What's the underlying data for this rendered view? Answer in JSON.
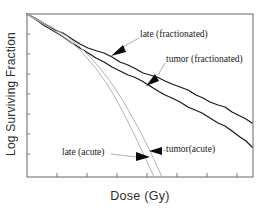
{
  "figure": {
    "x_axis_title": "Dose (Gy)",
    "y_axis_title": "Log Surviving Fraction"
  },
  "colors": {
    "background": "#ffffff",
    "frame": "#666666",
    "tick": "#777777",
    "fractionated_curve": "#1c1c1c",
    "acute_curve": "#b5b5b5",
    "leader_line": "#999999",
    "arrowhead": "#0d0d0d"
  },
  "chart_data": {
    "type": "line",
    "title": "",
    "xlabel": "Dose (Gy)",
    "ylabel": "Log Surviving Fraction",
    "axis_numeric_labels_shown": false,
    "grid": false,
    "legend_position": "in-plot annotations with arrows",
    "plot_box_px": {
      "left": 27,
      "top": 14,
      "right": 253,
      "bottom": 177
    },
    "x_ticks_px": [
      57,
      87,
      117,
      147,
      177,
      207,
      237
    ],
    "y_ticks_px": [
      34,
      54,
      74,
      94,
      114,
      134,
      154
    ],
    "tick_len_px": 4,
    "series": [
      {
        "name": "late (fractionated)",
        "color": "#1c1c1c",
        "width": 1.3,
        "points_px": [
          [
            27,
            14
          ],
          [
            35,
            18
          ],
          [
            45,
            24
          ],
          [
            55,
            30
          ],
          [
            63,
            33
          ],
          [
            72,
            39
          ],
          [
            80,
            44
          ],
          [
            88,
            48
          ],
          [
            97,
            51
          ],
          [
            104,
            53
          ],
          [
            112,
            57
          ],
          [
            120,
            62
          ],
          [
            128,
            65
          ],
          [
            136,
            69
          ],
          [
            143,
            73
          ],
          [
            150,
            75
          ],
          [
            157,
            77
          ],
          [
            165,
            81
          ],
          [
            172,
            84
          ],
          [
            180,
            87
          ],
          [
            188,
            90
          ],
          [
            196,
            95
          ],
          [
            203,
            98
          ],
          [
            210,
            102
          ],
          [
            218,
            105
          ],
          [
            225,
            107
          ],
          [
            232,
            112
          ],
          [
            240,
            116
          ],
          [
            246,
            119
          ],
          [
            252,
            123
          ]
        ]
      },
      {
        "name": "tumor (fractionated)",
        "color": "#1c1c1c",
        "width": 1.3,
        "points_px": [
          [
            27,
            14
          ],
          [
            35,
            19
          ],
          [
            45,
            26
          ],
          [
            52,
            30
          ],
          [
            62,
            36
          ],
          [
            72,
            43
          ],
          [
            80,
            48
          ],
          [
            88,
            53
          ],
          [
            96,
            58
          ],
          [
            104,
            62
          ],
          [
            112,
            67
          ],
          [
            120,
            71
          ],
          [
            128,
            75
          ],
          [
            134,
            77
          ],
          [
            142,
            81
          ],
          [
            150,
            86
          ],
          [
            158,
            91
          ],
          [
            165,
            95
          ],
          [
            172,
            98
          ],
          [
            180,
            102
          ],
          [
            188,
            107
          ],
          [
            195,
            110
          ],
          [
            202,
            113
          ],
          [
            210,
            118
          ],
          [
            218,
            123
          ],
          [
            225,
            126
          ],
          [
            232,
            131
          ],
          [
            240,
            137
          ],
          [
            246,
            141
          ],
          [
            252,
            147
          ]
        ]
      },
      {
        "name": "tumor(acute)",
        "color": "#b5b5b5",
        "width": 1,
        "points_px": [
          [
            27,
            14
          ],
          [
            40,
            21
          ],
          [
            55,
            29
          ],
          [
            68,
            37
          ],
          [
            80,
            47
          ],
          [
            90,
            57
          ],
          [
            100,
            68
          ],
          [
            110,
            81
          ],
          [
            120,
            96
          ],
          [
            130,
            113
          ],
          [
            140,
            131
          ],
          [
            150,
            151
          ],
          [
            157,
            166
          ],
          [
            162,
            177
          ]
        ]
      },
      {
        "name": "late (acute)",
        "color": "#b5b5b5",
        "width": 1,
        "points_px": [
          [
            27,
            14
          ],
          [
            40,
            22
          ],
          [
            55,
            31
          ],
          [
            67,
            39
          ],
          [
            79,
            49
          ],
          [
            88,
            59
          ],
          [
            97,
            70
          ],
          [
            107,
            84
          ],
          [
            116,
            99
          ],
          [
            125,
            116
          ],
          [
            134,
            134
          ],
          [
            143,
            153
          ],
          [
            150,
            168
          ],
          [
            154,
            177
          ]
        ]
      }
    ],
    "annotations": [
      {
        "label": "late (fractionated)",
        "leader_px": [
          [
            139,
            38
          ],
          [
            123,
            47
          ]
        ],
        "arrow_px": [
          [
            111,
            56
          ],
          [
            123,
            45
          ],
          [
            126,
            52
          ]
        ]
      },
      {
        "label": "tumor (fractionated)",
        "leader_px": [
          [
            165,
            63
          ],
          [
            158,
            75
          ]
        ],
        "arrow_px": [
          [
            146,
            86
          ],
          [
            155,
            74
          ],
          [
            159,
            81
          ]
        ]
      },
      {
        "label": "tumor(acute)",
        "leader_px": [
          [
            166,
            150
          ],
          [
            163,
            151
          ]
        ],
        "arrow_px": [
          [
            149,
            151
          ],
          [
            162,
            147
          ],
          [
            162,
            155
          ]
        ]
      },
      {
        "label": "late (acute)",
        "leader_px": [
          [
            111,
            154
          ],
          [
            136,
            157
          ]
        ],
        "arrow_px": [
          [
            150,
            157
          ],
          [
            136,
            152
          ],
          [
            136,
            161
          ]
        ]
      }
    ]
  }
}
